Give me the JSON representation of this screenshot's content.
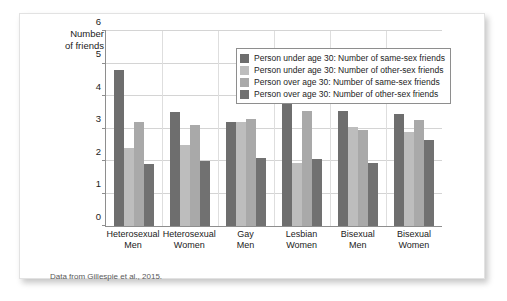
{
  "card": {
    "axis_title": "Number\nof friends",
    "caption": "Data from Gillespie et al., 2015."
  },
  "legend": {
    "items": [
      {
        "label": "Person under age 30: Number of same-sex friends",
        "color": "#6e6e6e"
      },
      {
        "label": "Person under age 30: Number of other-sex friends",
        "color": "#bdbdbd"
      },
      {
        "label": "Person over age 30: Number of same-sex friends",
        "color": "#a9a9a9"
      },
      {
        "label": "Person over age 30: Number of other-sex friends",
        "color": "#717171"
      }
    ]
  },
  "chart_data": {
    "type": "bar",
    "title": "",
    "xlabel": "",
    "ylabel": "Number of friends",
    "ylim": [
      0,
      6
    ],
    "yticks": [
      0,
      1,
      2,
      3,
      4,
      5,
      6
    ],
    "grid": true,
    "legend_position": "top-right",
    "categories": [
      "Heterosexual\nMen",
      "Heterosexual\nWomen",
      "Gay\nMen",
      "Lesbian\nWomen",
      "Bisexual\nMen",
      "Bisexual\nWomen"
    ],
    "series": [
      {
        "name": "Person under age 30: Number of same-sex friends",
        "color": "#6e6e6e",
        "values": [
          4.8,
          3.5,
          3.2,
          4.05,
          3.55,
          3.45
        ]
      },
      {
        "name": "Person under age 30: Number of other-sex friends",
        "color": "#bdbdbd",
        "values": [
          2.4,
          2.5,
          3.2,
          1.95,
          3.05,
          2.9
        ]
      },
      {
        "name": "Person over age 30: Number of same-sex friends",
        "color": "#a9a9a9",
        "values": [
          3.2,
          3.1,
          3.3,
          3.55,
          2.95,
          3.25
        ]
      },
      {
        "name": "Person over age 30: Number of other-sex friends",
        "color": "#717171",
        "values": [
          1.9,
          2.0,
          2.1,
          2.05,
          1.95,
          2.65
        ]
      }
    ]
  }
}
